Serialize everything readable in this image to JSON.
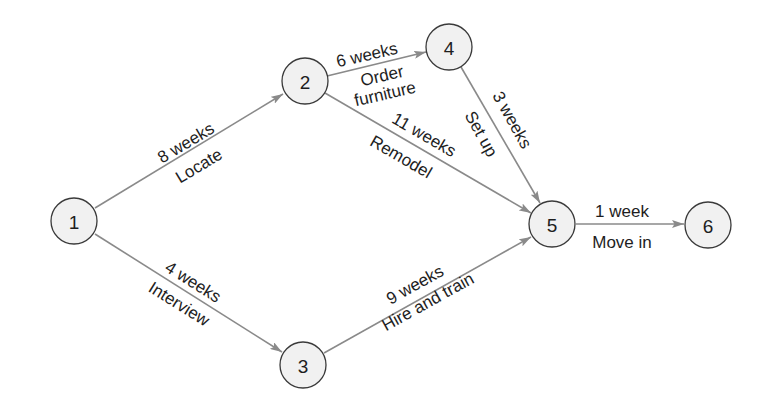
{
  "diagram": {
    "type": "network-activity-diagram",
    "nodes": [
      {
        "id": "1",
        "label": "1",
        "x": 74,
        "y": 221
      },
      {
        "id": "2",
        "label": "2",
        "x": 305,
        "y": 81
      },
      {
        "id": "3",
        "label": "3",
        "x": 303,
        "y": 365
      },
      {
        "id": "4",
        "label": "4",
        "x": 449,
        "y": 47
      },
      {
        "id": "5",
        "label": "5",
        "x": 552,
        "y": 224
      },
      {
        "id": "6",
        "label": "6",
        "x": 708,
        "y": 225
      }
    ],
    "edges": [
      {
        "from": "1",
        "to": "2",
        "duration": "8 weeks",
        "activity": "Locate"
      },
      {
        "from": "1",
        "to": "3",
        "duration": "4 weeks",
        "activity": "Interview"
      },
      {
        "from": "2",
        "to": "4",
        "duration": "6 weeks",
        "activity": "Order furniture",
        "activity_lines": [
          "Order",
          "furniture"
        ]
      },
      {
        "from": "2",
        "to": "5",
        "duration": "11 weeks",
        "activity": "Remodel"
      },
      {
        "from": "4",
        "to": "5",
        "duration": "3 weeks",
        "activity": "Set up"
      },
      {
        "from": "3",
        "to": "5",
        "duration": "9 weeks",
        "activity": "Hire and train"
      },
      {
        "from": "5",
        "to": "6",
        "duration": "1 week",
        "activity": "Move in"
      }
    ],
    "colors": {
      "edge": "#8a8a8a",
      "node_fill": "#f1f1f1",
      "node_stroke": "#3a3a3a",
      "text": "#1e1e1e"
    }
  }
}
